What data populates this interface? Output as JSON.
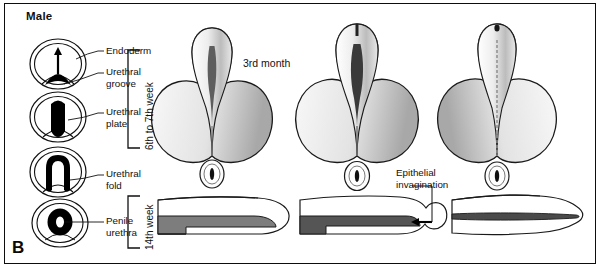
{
  "figure": {
    "panel_letter": "B",
    "title": "Male",
    "background_color": "#ffffff",
    "border_color": "#0d0d0d"
  },
  "labels": {
    "endoderm": "Endoderm",
    "urethral_groove": "Urethral\ngroove",
    "urethral_plate": "Urethral\nplate",
    "urethral_fold": "Urethral\nfold",
    "penile_urethra": "Penile\nurethra",
    "epithelial_invagination": "Epithelial\ninvagination"
  },
  "stage_brackets": [
    {
      "name": "early",
      "label": "6th to 7th week"
    },
    {
      "name": "late",
      "label": "14th week"
    }
  ],
  "timepoints": {
    "third_month": "3rd month"
  },
  "cross_sections": [
    {
      "name": "endoderm-urethral-groove",
      "structure": "arrow-with-black-mound",
      "fill": "#000000"
    },
    {
      "name": "urethral-plate",
      "structure": "solid-black-plate",
      "fill": "#000000"
    },
    {
      "name": "urethral-fold",
      "structure": "inverted-u-fold",
      "fill": "#000000"
    },
    {
      "name": "penile-urethra",
      "structure": "black-ring-with-lumen",
      "fill": "#000000"
    }
  ],
  "external_genitalia": [
    {
      "name": "stage-1-external-genitalia",
      "description": "phallus with open urethral groove and paired scrotal swellings"
    },
    {
      "name": "stage-2-external-genitalia",
      "description": "phallus with deepening urethral groove, swellings enlarging"
    },
    {
      "name": "stage-3-external-genitalia",
      "description": "fused penile urethra, scrotal swellings fused"
    }
  ],
  "longitudinal_sections": [
    {
      "name": "longitudinal-section-1",
      "description": "penis with urethral groove, glans solid",
      "channel_color": "#7d7d7d"
    },
    {
      "name": "longitudinal-section-2",
      "description": "penis with epithelial invagination entering glans",
      "channel_color": "#555555"
    },
    {
      "name": "longitudinal-section-3",
      "description": "penis with complete urethral canal through glans",
      "channel_color": "#4a4a4a"
    }
  ],
  "colors": {
    "ink": "#111111",
    "black_fill": "#000000",
    "shade_mid": "#9a9a9a",
    "shade_dark": "#6a6a6a"
  }
}
